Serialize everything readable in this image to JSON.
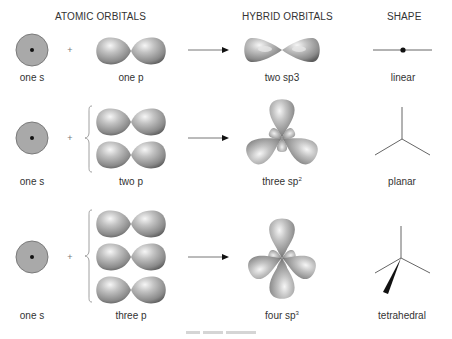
{
  "headers": {
    "atomic": "ATOMIC ORBITALS",
    "hybrid": "HYBRID ORBITALS",
    "shape": "SHAPE"
  },
  "rows": [
    {
      "s_label": "one s",
      "plus": "+",
      "p_label": "one p",
      "p_count": 1,
      "hybrid_label": "two sp3",
      "hybrid_sup": "",
      "shape_label": "linear"
    },
    {
      "s_label": "one s",
      "plus": "+",
      "p_label": "two p",
      "p_count": 2,
      "hybrid_label": "three sp",
      "hybrid_sup": "2",
      "shape_label": "planar"
    },
    {
      "s_label": "one s",
      "plus": "+",
      "p_label": "three p",
      "p_count": 3,
      "hybrid_label": "four sp",
      "hybrid_sup": "3",
      "shape_label": "tetrahedral"
    }
  ],
  "colors": {
    "s_orbital_fill": "#a9a9a9",
    "s_orbital_stroke": "#7a7a7a",
    "lobe_light": "#f2f2f2",
    "lobe_mid": "#a0a0a0",
    "lobe_dark": "#5e5e5e",
    "line": "#555555"
  }
}
